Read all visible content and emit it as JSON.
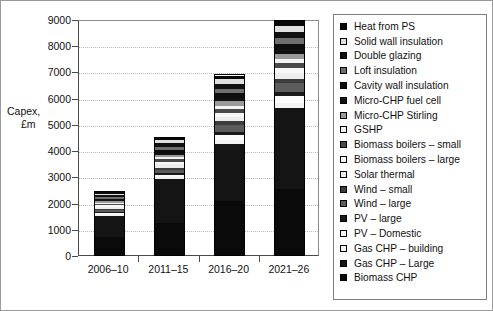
{
  "chart_data": {
    "type": "bar",
    "stacked": true,
    "title": "",
    "xlabel": "",
    "ylabel": "Capex, £m",
    "ylabel_line1": "Capex,",
    "ylabel_line2": "£m",
    "ylim": [
      0,
      9000
    ],
    "ytick_labels": [
      "9000",
      "8000",
      "7000",
      "6000",
      "5000",
      "4000",
      "3000",
      "2000",
      "1000",
      "0"
    ],
    "ytick_values": [
      9000,
      8000,
      7000,
      6000,
      5000,
      4000,
      3000,
      2000,
      1000,
      0
    ],
    "grid": true,
    "legend_position": "right",
    "categories": [
      "2006–10",
      "2011–15",
      "2016–20",
      "2021–26"
    ],
    "totals": [
      2400,
      4480,
      6480,
      8450
    ],
    "series": [
      {
        "name": "Biomass CHP",
        "color": "#0a0a0a",
        "values": [
          700,
          1220,
          2050,
          2500
        ]
      },
      {
        "name": "Gas CHP – Large",
        "color": "#141414",
        "values": [
          800,
          1670,
          2200,
          3100
        ]
      },
      {
        "name": "Gas CHP – building",
        "color": "#f2f2f2",
        "values": [
          60,
          90,
          130,
          180
        ]
      },
      {
        "name": "PV – Domestic",
        "color": "#fbfbfb",
        "values": [
          55,
          80,
          190,
          300
        ]
      },
      {
        "name": "PV – large",
        "color": "#1a1a1a",
        "values": [
          45,
          70,
          120,
          150
        ]
      },
      {
        "name": "Wind – large",
        "color": "#5c5c5c",
        "values": [
          60,
          110,
          260,
          330
        ]
      },
      {
        "name": "Wind – small",
        "color": "#3d3d3d",
        "values": [
          50,
          90,
          150,
          170
        ]
      },
      {
        "name": "Solar thermal",
        "color": "#ededed",
        "values": [
          70,
          130,
          180,
          220
        ]
      },
      {
        "name": "Biomass boilers – large",
        "color": "#f7f7f7",
        "values": [
          55,
          100,
          150,
          190
        ]
      },
      {
        "name": "Biomass boilers – small",
        "color": "#4a4a4a",
        "values": [
          50,
          90,
          140,
          170
        ]
      },
      {
        "name": "GSHP",
        "color": "#f4f4f4",
        "values": [
          45,
          80,
          130,
          160
        ]
      },
      {
        "name": "Micro-CHP Stirling",
        "color": "#9a9a9a",
        "values": [
          55,
          100,
          170,
          210
        ]
      },
      {
        "name": "Micro-CHP fuel cell",
        "color": "#121212",
        "values": [
          45,
          80,
          140,
          180
        ]
      },
      {
        "name": "Cavity wall insulation",
        "color": "#0d0d0d",
        "values": [
          60,
          110,
          160,
          200
        ]
      },
      {
        "name": "Loft insulation",
        "color": "#6e6e6e",
        "values": [
          65,
          120,
          170,
          210
        ]
      },
      {
        "name": "Double glazing",
        "color": "#101010",
        "values": [
          70,
          130,
          190,
          240
        ]
      },
      {
        "name": "Solid wall insulation",
        "color": "#e0e0e0",
        "values": [
          60,
          110,
          170,
          220
        ]
      },
      {
        "name": "Heat from PS",
        "color": "#080808",
        "values": [
          55,
          100,
          150,
          190
        ]
      }
    ]
  },
  "legend": {
    "items": [
      {
        "label": "Heat from PS",
        "color": "#080808"
      },
      {
        "label": "Solid wall insulation",
        "color": "#e0e0e0"
      },
      {
        "label": "Double glazing",
        "color": "#101010"
      },
      {
        "label": "Loft insulation",
        "color": "#6e6e6e"
      },
      {
        "label": "Cavity wall insulation",
        "color": "#0d0d0d"
      },
      {
        "label": "Micro-CHP fuel cell",
        "color": "#121212"
      },
      {
        "label": "Micro-CHP Stirling",
        "color": "#9a9a9a"
      },
      {
        "label": "GSHP",
        "color": "#f4f4f4"
      },
      {
        "label": "Biomass boilers – small",
        "color": "#4a4a4a"
      },
      {
        "label": "Biomass boilers – large",
        "color": "#f7f7f7"
      },
      {
        "label": "Solar thermal",
        "color": "#ededed"
      },
      {
        "label": "Wind – small",
        "color": "#3d3d3d"
      },
      {
        "label": "Wind – large",
        "color": "#5c5c5c"
      },
      {
        "label": "PV – large",
        "color": "#1a1a1a"
      },
      {
        "label": "PV – Domestic",
        "color": "#fbfbfb"
      },
      {
        "label": "Gas CHP – building",
        "color": "#f2f2f2"
      },
      {
        "label": "Gas CHP – Large",
        "color": "#141414"
      },
      {
        "label": "Biomass CHP",
        "color": "#0a0a0a"
      }
    ]
  }
}
